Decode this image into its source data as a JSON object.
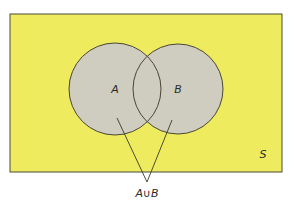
{
  "diagram": {
    "type": "venn",
    "universe": {
      "label": "S",
      "fill": "#eeec5e",
      "stroke": "#4a4a38"
    },
    "sets": [
      {
        "label": "A",
        "cx": 115,
        "cy": 89,
        "r": 46,
        "fill": "#cfcdbf"
      },
      {
        "label": "B",
        "cx": 178,
        "cy": 89,
        "r": 45,
        "fill": "#cfcdbf"
      }
    ],
    "annotation": {
      "label": "A∪B",
      "points_to": [
        "A",
        "B"
      ]
    }
  }
}
